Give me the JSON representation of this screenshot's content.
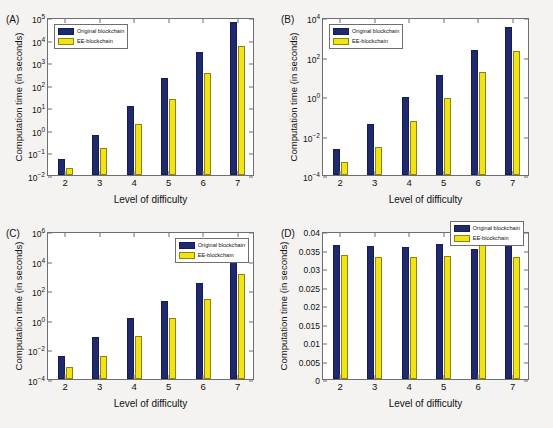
{
  "figure": {
    "background_color": "#f4f3f1",
    "series_colors": {
      "original": "#1f2a6e",
      "ee": "#f2e317"
    }
  },
  "legend": {
    "original_label": "Original blockchain",
    "ee_label": "EE-blockchain"
  },
  "panels": [
    {
      "tag": "(A)",
      "legend_position": "top-left"
    },
    {
      "tag": "(B)",
      "legend_position": "top-left"
    },
    {
      "tag": "(C)",
      "legend_position": "top-right"
    },
    {
      "tag": "(D)",
      "legend_position": "top-right"
    }
  ],
  "chart_data": [
    {
      "type": "bar",
      "panel": "(A)",
      "title": "",
      "xlabel": "Level of difficulty",
      "ylabel": "Computation time (in seconds)",
      "categories": [
        "2",
        "3",
        "4",
        "5",
        "6",
        "7"
      ],
      "yscale": "log",
      "ylim": [
        0.01,
        100000
      ],
      "yticks": [
        0.01,
        0.1,
        1,
        10,
        100,
        1000,
        10000,
        100000
      ],
      "ytick_labels": [
        "10-2",
        "10-1",
        "100",
        "101",
        "102",
        "103",
        "104",
        "105"
      ],
      "grid": false,
      "legend_position": "top-left",
      "series": [
        {
          "name": "Original blockchain",
          "values": [
            0.05,
            0.6,
            11,
            190,
            2800,
            60000
          ]
        },
        {
          "name": "EE-blockchain",
          "values": [
            0.021,
            0.15,
            1.9,
            24,
            340,
            5000
          ]
        }
      ]
    },
    {
      "type": "bar",
      "panel": "(B)",
      "title": "",
      "xlabel": "Level of difficulty",
      "ylabel": "Computation time (in seconds)",
      "categories": [
        "2",
        "3",
        "4",
        "5",
        "6",
        "7"
      ],
      "yscale": "log",
      "ylim": [
        0.0001,
        10000
      ],
      "yticks": [
        0.0001,
        0.01,
        1,
        100,
        10000
      ],
      "ytick_labels": [
        "10-4",
        "10-2",
        "100",
        "102",
        "104"
      ],
      "grid": false,
      "legend_position": "top-left",
      "series": [
        {
          "name": "Original blockchain",
          "values": [
            0.0022,
            0.037,
            0.85,
            12,
            220,
            3300
          ]
        },
        {
          "name": "EE-blockchain",
          "values": [
            0.00048,
            0.0027,
            0.055,
            0.78,
            17,
            190
          ]
        }
      ]
    },
    {
      "type": "bar",
      "panel": "(C)",
      "title": "",
      "xlabel": "Level of difficulty",
      "ylabel": "Computation time (in seconds)",
      "categories": [
        "2",
        "3",
        "4",
        "5",
        "6",
        "7"
      ],
      "yscale": "log",
      "ylim": [
        0.0001,
        1000000
      ],
      "yticks": [
        0.0001,
        0.01,
        1,
        100,
        10000,
        1000000
      ],
      "ytick_labels": [
        "10-4",
        "10-2",
        "100",
        "102",
        "104",
        "106"
      ],
      "grid": false,
      "legend_position": "top-right",
      "series": [
        {
          "name": "Original blockchain",
          "values": [
            0.0038,
            0.065,
            1.4,
            18,
            320,
            11000
          ]
        },
        {
          "name": "EE-blockchain",
          "values": [
            0.0007,
            0.0035,
            0.075,
            1.3,
            24,
            1300
          ]
        }
      ]
    },
    {
      "type": "bar",
      "panel": "(D)",
      "title": "",
      "xlabel": "Level of difficulty",
      "ylabel": "Computation time (in seconds)",
      "categories": [
        "2",
        "3",
        "4",
        "5",
        "6",
        "7"
      ],
      "yscale": "linear",
      "ylim": [
        0,
        0.04
      ],
      "yticks": [
        0,
        0.005,
        0.01,
        0.015,
        0.02,
        0.025,
        0.03,
        0.035,
        0.04
      ],
      "ytick_labels": [
        "0",
        "0.005",
        "0.01",
        "0.015",
        "0.02",
        "0.025",
        "0.03",
        "0.035",
        "0.04"
      ],
      "grid": false,
      "legend_position": "top-right",
      "series": [
        {
          "name": "Original blockchain",
          "values": [
            0.0362,
            0.0359,
            0.0357,
            0.0366,
            0.0352,
            0.0363
          ]
        },
        {
          "name": "EE-blockchain",
          "values": [
            0.0334,
            0.033,
            0.033,
            0.0332,
            0.0371,
            0.0331
          ]
        }
      ]
    }
  ]
}
